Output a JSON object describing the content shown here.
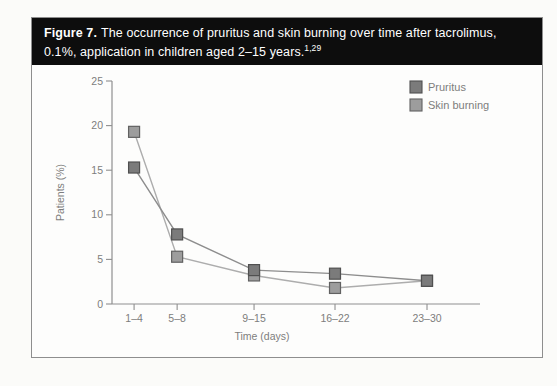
{
  "figure": {
    "label": "Figure 7.",
    "caption": "The occurrence of pruritus and skin burning over time after tacrolimus, 0.1%, application in children aged 2–15 years.",
    "reference": "1,29"
  },
  "chart_data": {
    "type": "line",
    "title": "",
    "xlabel": "Time (days)",
    "ylabel": "Patients (%)",
    "categories": [
      "1–4",
      "5–8",
      "9–15",
      "16–22",
      "23–30"
    ],
    "ylim": [
      0,
      25
    ],
    "yticks": [
      0,
      5,
      10,
      15,
      20,
      25
    ],
    "grid": "off",
    "legend_position": "top-right",
    "x_fractions": [
      0.06,
      0.177,
      0.386,
      0.606,
      0.856
    ],
    "series": [
      {
        "name": "Pruritus",
        "values": [
          15.3,
          7.8,
          3.8,
          3.4,
          2.6
        ],
        "marker_fill": "#7b7b7b",
        "marker_stroke": "#505050",
        "line_color": "#8d8d8d"
      },
      {
        "name": "Skin burning",
        "values": [
          19.3,
          5.3,
          3.2,
          1.8,
          2.6
        ],
        "marker_fill": "#9d9d9d",
        "marker_stroke": "#616161",
        "line_color": "#adadad"
      }
    ],
    "colors": {
      "axis": "#8f8f8f",
      "text": "#7d7d7d"
    }
  }
}
